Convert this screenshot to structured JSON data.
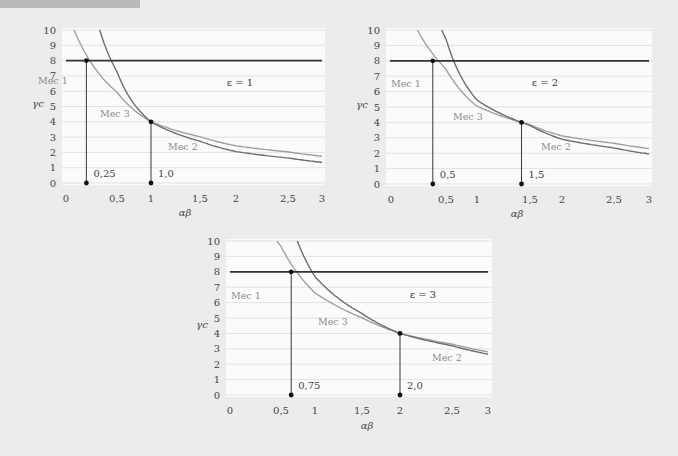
{
  "colors": {
    "background": "#ececec",
    "plot_bg": "#fbfbfb",
    "grid": "#dcdcdc",
    "threshold_line": "#333333",
    "mec3_curve": "#a0a0a0",
    "mec2_curve": "#6e6e6e",
    "marker": "#111111",
    "label_gray": "#8a8a8a"
  },
  "chart_data": [
    {
      "type": "line",
      "title": "ε = 1",
      "xlabel": "αβ",
      "ylabel": "γc",
      "xlim": [
        0,
        3
      ],
      "ylim": [
        0,
        10
      ],
      "grid": true,
      "x_ticks": [
        "0",
        "0,5",
        "1",
        "1,5",
        "2",
        "2,5",
        "3"
      ],
      "y_ticks": [
        "0",
        "1",
        "2",
        "3",
        "4",
        "5",
        "6",
        "7",
        "8",
        "9",
        "10"
      ],
      "threshold": {
        "y": 8
      },
      "regions": [
        "Mec 1",
        "Mec 3",
        "Mec 2"
      ],
      "markers": [
        {
          "label": "0,25",
          "x_axis": 0.2,
          "y": 8
        },
        {
          "label": "1,0",
          "x_axis": 1.0,
          "y": 4
        }
      ],
      "series": [
        {
          "name": "Mec 3 boundary",
          "points": [
            [
              0.08,
              10
            ],
            [
              0.2,
              8
            ],
            [
              1.0,
              4
            ],
            [
              3,
              1.75
            ]
          ]
        },
        {
          "name": "Mec 2 boundary",
          "points": [
            [
              0.33,
              10
            ],
            [
              1.0,
              4
            ],
            [
              3,
              1.35
            ]
          ]
        }
      ]
    },
    {
      "type": "line",
      "title": "ε = 2",
      "xlabel": "αβ",
      "ylabel": "γc",
      "xlim": [
        0,
        3
      ],
      "ylim": [
        0,
        10
      ],
      "grid": true,
      "x_ticks": [
        "0",
        "0,5",
        "1",
        "1,5",
        "2",
        "2,5",
        "3"
      ],
      "y_ticks": [
        "0",
        "1",
        "2",
        "3",
        "4",
        "5",
        "6",
        "7",
        "8",
        "9",
        "10"
      ],
      "threshold": {
        "y": 8
      },
      "regions": [
        "Mec 1",
        "Mec 3",
        "Mec 2"
      ],
      "markers": [
        {
          "label": "0,5",
          "x_axis": 0.38,
          "y": 8
        },
        {
          "label": "1,5",
          "x_axis": 1.42,
          "y": 4
        }
      ],
      "series": [
        {
          "name": "Mec 3 boundary",
          "points": [
            [
              0.24,
              10
            ],
            [
              0.38,
              8
            ],
            [
              1.42,
              4
            ],
            [
              3,
              2.3
            ]
          ]
        },
        {
          "name": "Mec 2 boundary",
          "points": [
            [
              0.46,
              10
            ],
            [
              1.42,
              4
            ],
            [
              3,
              1.95
            ]
          ]
        }
      ]
    },
    {
      "type": "line",
      "title": "ε = 3",
      "xlabel": "αβ",
      "ylabel": "γc",
      "xlim": [
        0,
        3
      ],
      "ylim": [
        0,
        10
      ],
      "grid": true,
      "x_ticks": [
        "0",
        "0,5",
        "1",
        "1,5",
        "2",
        "2,5",
        "3"
      ],
      "y_ticks": [
        "0",
        "1",
        "2",
        "3",
        "4",
        "5",
        "6",
        "7",
        "8",
        "9",
        "10"
      ],
      "threshold": {
        "y": 8
      },
      "regions": [
        "Mec 1",
        "Mec 3",
        "Mec 2"
      ],
      "markers": [
        {
          "label": "0,75",
          "x_axis": 0.65,
          "y": 8
        },
        {
          "label": "2,0",
          "x_axis": 2.0,
          "y": 4
        }
      ],
      "series": [
        {
          "name": "Mec 3 boundary",
          "points": [
            [
              0.46,
              10
            ],
            [
              0.65,
              8
            ],
            [
              2.0,
              4
            ],
            [
              3,
              2.8
            ]
          ]
        },
        {
          "name": "Mec 2 boundary",
          "points": [
            [
              0.74,
              10
            ],
            [
              2.0,
              4
            ],
            [
              3,
              2.65
            ]
          ]
        }
      ]
    }
  ],
  "layout": [
    {
      "plot": {
        "left": 62,
        "right": 325,
        "top": 30,
        "bottom": 183
      },
      "tick_px": [
        66,
        117,
        151,
        200,
        236,
        288,
        322
      ],
      "line_x": [
        66,
        322
      ],
      "ylabel_pos": [
        38,
        107
      ],
      "xlabel_pos": [
        185,
        216
      ],
      "eps_pos": [
        240,
        86
      ],
      "mec_pos": [
        [
          38,
          84
        ],
        [
          100,
          117
        ],
        [
          168,
          150
        ]
      ]
    },
    {
      "plot": {
        "left": 386,
        "right": 652,
        "top": 30,
        "bottom": 184
      },
      "tick_px": [
        391,
        446,
        477,
        530,
        562,
        614,
        649
      ],
      "line_x": [
        390,
        649
      ],
      "ylabel_pos": [
        362,
        108
      ],
      "xlabel_pos": [
        517,
        217
      ],
      "eps_pos": [
        545,
        86
      ],
      "mec_pos": [
        [
          391,
          87
        ],
        [
          453,
          120
        ],
        [
          541,
          150
        ]
      ]
    },
    {
      "plot": {
        "left": 226,
        "right": 492,
        "top": 241,
        "bottom": 395
      },
      "tick_px": [
        230,
        281,
        315,
        362,
        400,
        452,
        488
      ],
      "line_x": [
        230,
        488
      ],
      "ylabel_pos": [
        202,
        328
      ],
      "xlabel_pos": [
        367,
        429
      ],
      "eps_pos": [
        423,
        298
      ],
      "mec_pos": [
        [
          231,
          299
        ],
        [
          318,
          325
        ],
        [
          432,
          361
        ]
      ]
    }
  ]
}
